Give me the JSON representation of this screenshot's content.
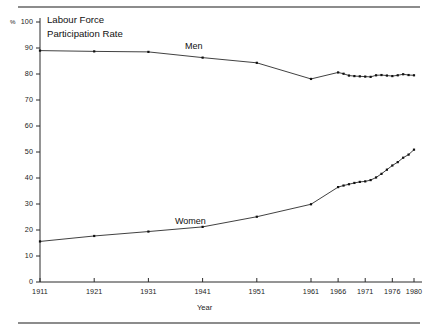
{
  "figure": {
    "title_lines": [
      "Labour Force",
      "Participation Rate"
    ],
    "percent_symbol": "%",
    "xaxis_title": "Year",
    "series_labels": {
      "men": "Men",
      "women": "Women"
    },
    "rule_color": "#8c8c8c",
    "line_color": "#2b2b2b",
    "marker_color": "#111111"
  },
  "chart_data": {
    "type": "line",
    "title": "Labour Force Participation Rate",
    "xlabel": "Year",
    "ylabel": "%",
    "xlim": [
      1911,
      1980
    ],
    "ylim": [
      0,
      100
    ],
    "grid": false,
    "legend": "inline-annotations",
    "yticks": [
      0,
      10,
      20,
      30,
      40,
      50,
      60,
      70,
      80,
      90,
      100
    ],
    "ytick_labels": [
      "0",
      "10",
      "20",
      "30",
      "40",
      "50",
      "60",
      "70",
      "80",
      "90",
      "100"
    ],
    "xticks": [
      1911,
      1921,
      1931,
      1941,
      1951,
      1961,
      1966,
      1971,
      1976,
      1980
    ],
    "xtick_labels": [
      "1911",
      "1921",
      "1931",
      "1941",
      "1951",
      "1961",
      "1966",
      "1971",
      "1976",
      "1980"
    ],
    "series": [
      {
        "name": "Men",
        "x": [
          1911,
          1921,
          1931,
          1941,
          1951,
          1961,
          1966,
          1967,
          1968,
          1969,
          1970,
          1971,
          1972,
          1973,
          1974,
          1975,
          1976,
          1977,
          1978,
          1979,
          1980
        ],
        "values": [
          89.0,
          88.7,
          88.5,
          86.3,
          84.3,
          78.1,
          80.6,
          80.1,
          79.4,
          79.2,
          79.1,
          79.0,
          78.9,
          79.5,
          79.6,
          79.4,
          79.2,
          79.5,
          79.9,
          79.6,
          79.5
        ]
      },
      {
        "name": "Women",
        "x": [
          1911,
          1921,
          1931,
          1941,
          1951,
          1961,
          1966,
          1967,
          1968,
          1969,
          1970,
          1971,
          1972,
          1973,
          1974,
          1975,
          1976,
          1977,
          1978,
          1979,
          1980
        ],
        "values": [
          15.6,
          17.7,
          19.4,
          21.2,
          25.1,
          29.9,
          36.5,
          37.1,
          37.6,
          38.1,
          38.5,
          38.7,
          39.2,
          40.2,
          41.6,
          43.2,
          44.8,
          46.1,
          47.8,
          49.0,
          50.9
        ]
      }
    ]
  }
}
